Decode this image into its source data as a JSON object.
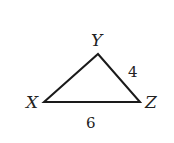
{
  "diagram": {
    "type": "triangle",
    "vertices": [
      {
        "name": "X",
        "x": 44,
        "y": 102
      },
      {
        "name": "Y",
        "x": 98,
        "y": 54
      },
      {
        "name": "Z",
        "x": 140,
        "y": 102
      }
    ],
    "side_labels": {
      "YZ": "4",
      "XZ": "6"
    },
    "stroke_color": "#1a1a1a"
  }
}
